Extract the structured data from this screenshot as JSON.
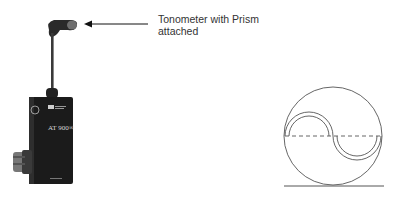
{
  "figure": {
    "annotation": {
      "text_line1": "Tonometer with Prism",
      "text_line2": "attached"
    },
    "device": {
      "name": "tonometer",
      "model_label": "AT 900®",
      "body_color": "#1b1b1b"
    },
    "diagram": {
      "description": "applanation mires (semi-circles) aligned inside circle",
      "line_color": "#555555"
    }
  }
}
